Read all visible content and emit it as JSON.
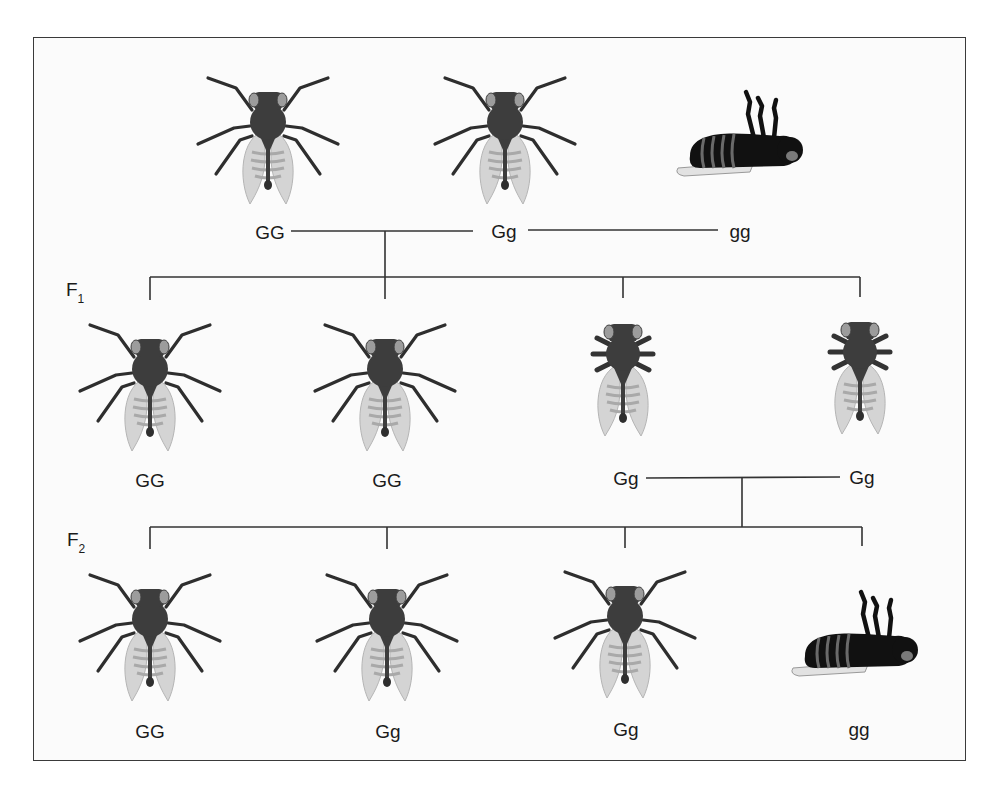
{
  "diagram": {
    "title": "",
    "type": "genetic cross pedigree (Drosophila)",
    "colors": {
      "body": "#3d3d3d",
      "eye": "#9a9a9a",
      "wing": "#d2d2d2",
      "wing_stripe": "#a8a8a8",
      "dead_body": "#111111",
      "line": "#333333",
      "frame": "#3a3a3a"
    },
    "parental": {
      "individuals": [
        {
          "genotype": "GG",
          "phenotype": "normal-legs"
        },
        {
          "genotype": "Gg",
          "phenotype": "normal-legs"
        },
        {
          "genotype": "gg",
          "phenotype": "dead"
        }
      ]
    },
    "f1": {
      "label": "F",
      "subscript": "1",
      "individuals": [
        {
          "genotype": "GG",
          "phenotype": "normal-legs"
        },
        {
          "genotype": "GG",
          "phenotype": "normal-legs"
        },
        {
          "genotype": "Gg",
          "phenotype": "short-legs"
        },
        {
          "genotype": "Gg",
          "phenotype": "short-legs"
        }
      ]
    },
    "f2": {
      "label": "F",
      "subscript": "2",
      "individuals": [
        {
          "genotype": "GG",
          "phenotype": "normal-legs"
        },
        {
          "genotype": "Gg",
          "phenotype": "normal-legs"
        },
        {
          "genotype": "Gg",
          "phenotype": "normal-legs"
        },
        {
          "genotype": "gg",
          "phenotype": "dead"
        }
      ]
    }
  }
}
